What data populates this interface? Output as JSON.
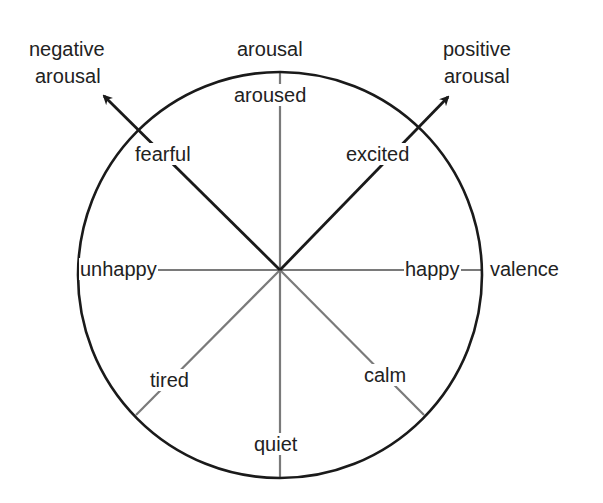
{
  "diagram": {
    "axes": {
      "vertical": "arousal",
      "horizontal": "valence",
      "diagonal_left": "negative arousal",
      "diagonal_right": "positive arousal"
    },
    "axis_labels": {
      "arousal": "arousal",
      "valence": "valence",
      "negative_arousal_line1": "negative",
      "negative_arousal_line2": "arousal",
      "positive_arousal_line1": "positive",
      "positive_arousal_line2": "arousal"
    },
    "emotions": {
      "top": "aroused",
      "top_right": "excited",
      "right": "happy",
      "bottom_right": "calm",
      "bottom": "quiet",
      "bottom_left": "tired",
      "left": "unhappy",
      "top_left": "fearful"
    },
    "colors": {
      "circle": "#1a1a1a",
      "arrow_lines": "#1a1a1a",
      "spokes": "#7a7a7a",
      "text": "#222222"
    }
  }
}
